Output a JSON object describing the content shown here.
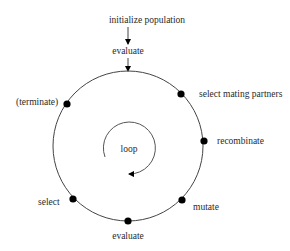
{
  "diagram": {
    "colors": {
      "line": "#444444",
      "dot": "#000000",
      "text": "#2a2a2a",
      "background": "#ffffff"
    },
    "entry": {
      "init_label": "initialize population",
      "first_eval_label": "evaluate"
    },
    "cycle": {
      "nodes": [
        {
          "id": "select-mating-partners",
          "label": "select mating partners"
        },
        {
          "id": "recombinate",
          "label": "recombinate"
        },
        {
          "id": "mutate",
          "label": "mutate"
        },
        {
          "id": "evaluate",
          "label": "evaluate"
        },
        {
          "id": "select",
          "label": "select"
        },
        {
          "id": "terminate",
          "label": "(terminate)"
        }
      ]
    },
    "loop_label": "loop"
  }
}
